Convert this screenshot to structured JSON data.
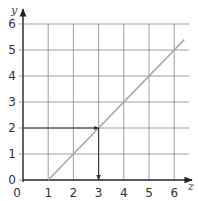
{
  "chart_data": {
    "type": "line",
    "title": "",
    "xlabel": "z",
    "ylabel": "y",
    "xlim": [
      0,
      6.6
    ],
    "ylim": [
      0,
      6.4
    ],
    "x_ticks": [
      "0",
      "1",
      "2",
      "3",
      "4",
      "5",
      "6"
    ],
    "y_ticks": [
      "0",
      "1",
      "2",
      "3",
      "4",
      "5",
      "6"
    ],
    "grid": true,
    "series": [
      {
        "name": "line",
        "color": "#aaaaaa",
        "x": [
          1,
          6.4
        ],
        "y": [
          0,
          5.4
        ]
      }
    ],
    "annotations": [
      {
        "type": "arrow",
        "from": [
          0,
          2
        ],
        "to": [
          3,
          2
        ],
        "description": "horizontal arrow from y=2 to the line"
      },
      {
        "type": "arrow",
        "from": [
          3,
          2
        ],
        "to": [
          3,
          0
        ],
        "description": "vertical arrow down from the line to z=3"
      }
    ],
    "colors": {
      "axis": "#222222",
      "grid": "#888888",
      "line": "#aaaaaa",
      "arrow": "#333333"
    }
  }
}
